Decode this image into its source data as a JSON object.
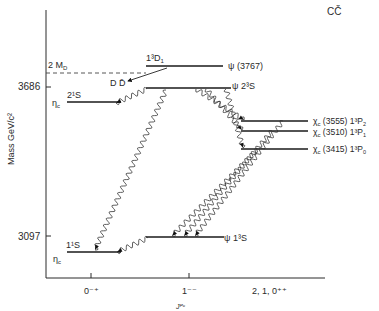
{
  "title": "CČ",
  "y_axis": {
    "label": "Mass GeV/c²",
    "ticks": [
      {
        "label": "3686",
        "y": 87
      },
      {
        "label": "3097",
        "y": 236
      }
    ]
  },
  "x_axis": {
    "label": "Jᴾᶜ",
    "ticks": [
      {
        "label": "0⁻⁺",
        "x": 91
      },
      {
        "label": "1⁻⁻",
        "x": 189
      },
      {
        "label": "2, 1, 0⁺⁺",
        "x": 272
      }
    ]
  },
  "threshold": {
    "label": "2 M",
    "sub": "D",
    "decay_label": "D D̄"
  },
  "levels": {
    "psi3767": {
      "name": "ψ",
      "mass": "(3767)",
      "term": "1³D",
      "term_sub": "1"
    },
    "psi2S": {
      "name": "ψ",
      "term": "2³S"
    },
    "etac2S": {
      "name": "η",
      "name_sub": "c",
      "term": "2¹S"
    },
    "chi2": {
      "name": "χ",
      "name_sub": "c",
      "mass": "(3555)",
      "term": "1³P",
      "term_sub": "2"
    },
    "chi1": {
      "name": "χ",
      "name_sub": "c",
      "mass": "(3510)",
      "term": "1³P",
      "term_sub": "1"
    },
    "chi0": {
      "name": "χ",
      "name_sub": "c",
      "mass": "(3415)",
      "term": "1³P",
      "term_sub": "0"
    },
    "psi1S": {
      "name": "ψ",
      "term": "1³S"
    },
    "etac1S": {
      "name": "η",
      "name_sub": "c",
      "term": "1¹S"
    }
  },
  "chart_data": {
    "type": "energy-level-diagram",
    "title": "CČ",
    "ylabel": "Mass GeV/c²",
    "xlabel": "J^PC",
    "categories": [
      "0-+",
      "1--",
      "2, 1, 0++"
    ],
    "threshold": {
      "label": "2 M_D",
      "mass": 3730
    },
    "levels": [
      {
        "state": "ηc 1¹S",
        "jpc": "0-+",
        "mass": 2980
      },
      {
        "state": "ηc 2¹S",
        "jpc": "0-+",
        "mass": 3590
      },
      {
        "state": "ψ 1³S",
        "jpc": "1--",
        "mass": 3097
      },
      {
        "state": "ψ 2³S",
        "jpc": "1--",
        "mass": 3686
      },
      {
        "state": "ψ (3767) 1³D₁",
        "jpc": "1--",
        "mass": 3767
      },
      {
        "state": "χc (3555) 1³P₂",
        "jpc": "2++",
        "mass": 3555
      },
      {
        "state": "χc (3510) 1³P₁",
        "jpc": "1++",
        "mass": 3510
      },
      {
        "state": "χc (3415) 1³P₀",
        "jpc": "0++",
        "mass": 3415
      }
    ],
    "transitions": [
      {
        "from": "ψ (3767)",
        "to": "D D̄",
        "type": "hadronic"
      },
      {
        "from": "ψ 2³S",
        "to": "ηc 2¹S",
        "type": "radiative"
      },
      {
        "from": "ψ 2³S",
        "to": "ηc 1¹S",
        "type": "radiative"
      },
      {
        "from": "ψ 2³S",
        "to": "χc (3555)",
        "type": "radiative"
      },
      {
        "from": "ψ 2³S",
        "to": "χc (3510)",
        "type": "radiative"
      },
      {
        "from": "ψ 2³S",
        "to": "χc (3415)",
        "type": "radiative"
      },
      {
        "from": "χc (3555)",
        "to": "ψ 1³S",
        "type": "radiative"
      },
      {
        "from": "χc (3510)",
        "to": "ψ 1³S",
        "type": "radiative"
      },
      {
        "from": "χc (3415)",
        "to": "ψ 1³S",
        "type": "radiative"
      },
      {
        "from": "ψ 1³S",
        "to": "ηc 1¹S",
        "type": "radiative"
      }
    ]
  }
}
